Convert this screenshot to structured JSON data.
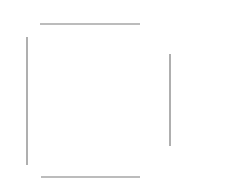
{
  "diagram": {
    "background": "#ffffff",
    "stroke_color": "#7a7a7a",
    "stroke_width": 1.2,
    "segments": [
      {
        "name": "top-line",
        "x1": 40,
        "y1": 24,
        "x2": 140,
        "y2": 24
      },
      {
        "name": "left-line",
        "x1": 27,
        "y1": 37,
        "x2": 27,
        "y2": 165
      },
      {
        "name": "right-line",
        "x1": 170,
        "y1": 54,
        "x2": 170,
        "y2": 146
      },
      {
        "name": "bottom-line",
        "x1": 41,
        "y1": 177,
        "x2": 140,
        "y2": 177
      }
    ]
  }
}
